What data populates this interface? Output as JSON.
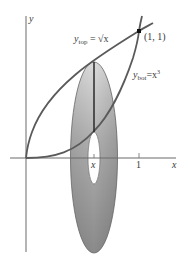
{
  "diagram": {
    "type": "washer-method-volume-of-revolution",
    "axes": {
      "x_label": "x",
      "y_label": "y",
      "x_ticks": [
        {
          "label": "x",
          "value": "x"
        },
        {
          "label": "1",
          "value": 1
        }
      ]
    },
    "curves": [
      {
        "name": "y_top",
        "label_main": "y",
        "label_sub": "top",
        "equation": "= √x",
        "equation_var": "x"
      },
      {
        "name": "y_bot",
        "label_main": "y",
        "label_sub": "bot",
        "equation": "=x",
        "equation_sup": "3"
      }
    ],
    "intersection_point": {
      "label": "(1, 1)"
    },
    "washer": {
      "outer_radius": "√x",
      "inner_radius": "x³",
      "axis_of_rotation": "x-axis"
    },
    "colors": {
      "curve": "#5a5a5a",
      "axis": "#6a6a6a",
      "washer_light": "#d4d4d4",
      "washer_dark": "#8e8e8e",
      "text": "#3a3a3a"
    }
  }
}
